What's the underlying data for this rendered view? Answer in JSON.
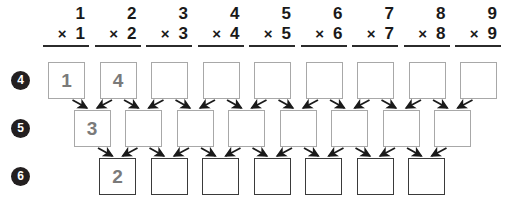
{
  "worksheet": {
    "title": "Multiplication arrow pyramid worksheet",
    "width": 529,
    "height": 204,
    "colors": {
      "ink": "#1a1a1a",
      "marker_fill": "#231f20",
      "marker_text": "#ffffff",
      "cell_border_light": "#a8a8a8",
      "cell_border_dark": "#3a3a3a",
      "cell_text": "#7a7a7a",
      "arrow": "#1a1a1a",
      "background": "#ffffff"
    }
  },
  "columns": [
    {
      "index": 1,
      "multiplicand": "1",
      "multiplier": "1",
      "operator": "×"
    },
    {
      "index": 2,
      "multiplicand": "2",
      "multiplier": "2",
      "operator": "×"
    },
    {
      "index": 3,
      "multiplicand": "3",
      "multiplier": "3",
      "operator": "×"
    },
    {
      "index": 4,
      "multiplicand": "4",
      "multiplier": "4",
      "operator": "×"
    },
    {
      "index": 5,
      "multiplicand": "5",
      "multiplier": "5",
      "operator": "×"
    },
    {
      "index": 6,
      "multiplicand": "6",
      "multiplier": "6",
      "operator": "×"
    },
    {
      "index": 7,
      "multiplicand": "7",
      "multiplier": "7",
      "operator": "×"
    },
    {
      "index": 8,
      "multiplicand": "8",
      "multiplier": "8",
      "operator": "×"
    },
    {
      "index": 9,
      "multiplicand": "9",
      "multiplier": "9",
      "operator": "×"
    }
  ],
  "rows": [
    {
      "marker": "4",
      "style": "light",
      "cells": [
        {
          "value": "1",
          "filled": true
        },
        {
          "value": "4",
          "filled": true
        },
        {
          "value": "",
          "filled": false
        },
        {
          "value": "",
          "filled": false
        },
        {
          "value": "",
          "filled": false
        },
        {
          "value": "",
          "filled": false
        },
        {
          "value": "",
          "filled": false
        },
        {
          "value": "",
          "filled": false
        },
        {
          "value": "",
          "filled": false
        }
      ]
    },
    {
      "marker": "5",
      "style": "light",
      "cells": [
        {
          "value": "3",
          "filled": true
        },
        {
          "value": "",
          "filled": false
        },
        {
          "value": "",
          "filled": false
        },
        {
          "value": "",
          "filled": false
        },
        {
          "value": "",
          "filled": false
        },
        {
          "value": "",
          "filled": false
        },
        {
          "value": "",
          "filled": false
        },
        {
          "value": "",
          "filled": false
        }
      ]
    },
    {
      "marker": "6",
      "style": "dark",
      "cells": [
        {
          "value": "2",
          "filled": true
        },
        {
          "value": "",
          "filled": false
        },
        {
          "value": "",
          "filled": false
        },
        {
          "value": "",
          "filled": false
        },
        {
          "value": "",
          "filled": false
        },
        {
          "value": "",
          "filled": false
        },
        {
          "value": "",
          "filled": false
        }
      ]
    }
  ]
}
